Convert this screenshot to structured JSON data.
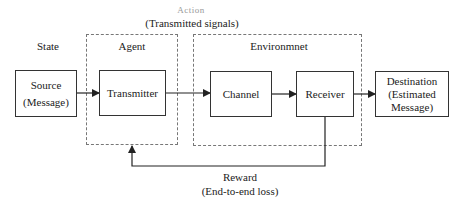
{
  "diagram": {
    "top_label_faint": "Action",
    "top_label": "(Transmitted signals)",
    "state_label": "State",
    "agent_group_label": "Agent",
    "environment_group_label": "Environmnet",
    "nodes": {
      "source": {
        "line1": "Source",
        "line2": "(Message)"
      },
      "transmitter": {
        "label": "Transmitter"
      },
      "channel": {
        "label": "Channel"
      },
      "receiver": {
        "label": "Receiver"
      },
      "destination": {
        "line1": "Destination",
        "line2": "(Estimated",
        "line3": "Message)"
      }
    },
    "reward_label": "Reward",
    "reward_sublabel": "(End-to-end loss)",
    "edges": [
      {
        "from": "source",
        "to": "transmitter"
      },
      {
        "from": "transmitter",
        "to": "channel"
      },
      {
        "from": "channel",
        "to": "receiver"
      },
      {
        "from": "receiver",
        "to": "destination"
      },
      {
        "from": "receiver",
        "to": "agent",
        "label": "Reward (End-to-end loss)"
      }
    ]
  }
}
